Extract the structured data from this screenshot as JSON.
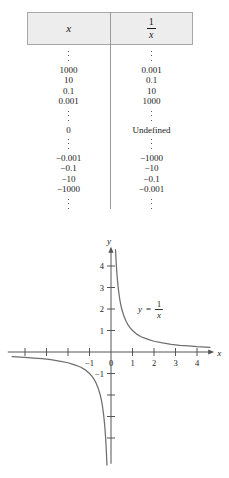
{
  "figure": {
    "title": "",
    "table": {
      "headers": {
        "left": "x",
        "right_numerator": "1",
        "right_denominator": "x"
      },
      "rows": [
        {
          "x": "⋮",
          "inv": "⋮",
          "type": "dots"
        },
        {
          "x": "1000",
          "inv": "0.001",
          "type": "value"
        },
        {
          "x": "10",
          "inv": "0.1",
          "type": "value"
        },
        {
          "x": "0.1",
          "inv": "10",
          "type": "value"
        },
        {
          "x": "0.001",
          "inv": "1000",
          "type": "value"
        },
        {
          "x": "⋮",
          "inv": "⋮",
          "type": "dots"
        },
        {
          "x": "0",
          "inv": "Undefined",
          "type": "value"
        },
        {
          "x": "⋮",
          "inv": "⋮",
          "type": "dots"
        },
        {
          "x": "−0.001",
          "inv": "−1000",
          "type": "value"
        },
        {
          "x": "−0.1",
          "inv": "−10",
          "type": "value"
        },
        {
          "x": "−10",
          "inv": "−0.1",
          "type": "value"
        },
        {
          "x": "−1000",
          "inv": "−0.001",
          "type": "value"
        },
        {
          "x": "⋮",
          "inv": "⋮",
          "type": "dots"
        }
      ]
    }
  },
  "chart_data": {
    "type": "line",
    "title": "",
    "xlabel": "x",
    "ylabel": "y",
    "xlim": [
      -4.8,
      4.8
    ],
    "ylim": [
      -5.2,
      4.9
    ],
    "grid": false,
    "legend": "none",
    "annotations": [
      {
        "text": "y = 1/x",
        "numerator": "1",
        "denominator": "x",
        "lhs": "y",
        "equals": "=",
        "x": 1.25,
        "y": 2.0
      }
    ],
    "x_ticks": [
      {
        "value": -4,
        "label": ""
      },
      {
        "value": -3,
        "label": ""
      },
      {
        "value": -2,
        "label": ""
      },
      {
        "value": -1,
        "label": "−1"
      },
      {
        "value": 0,
        "label": "0"
      },
      {
        "value": 1,
        "label": "1"
      },
      {
        "value": 2,
        "label": "2"
      },
      {
        "value": 3,
        "label": "3"
      },
      {
        "value": 4,
        "label": "4"
      }
    ],
    "y_ticks": [
      {
        "value": 4,
        "label": "4"
      },
      {
        "value": 3,
        "label": "3"
      },
      {
        "value": 2,
        "label": "2"
      },
      {
        "value": 1,
        "label": "1"
      },
      {
        "value": -1,
        "label": "−1"
      },
      {
        "value": -2,
        "label": ""
      },
      {
        "value": -3,
        "label": ""
      },
      {
        "value": -4,
        "label": ""
      }
    ],
    "series": [
      {
        "name": "y = 1/x (branch x > 0)",
        "x": [
          0.21,
          0.23,
          0.25,
          0.28,
          0.3,
          0.35,
          0.4,
          0.45,
          0.5,
          0.6,
          0.7,
          0.8,
          0.9,
          1.0,
          1.2,
          1.4,
          1.6,
          1.8,
          2.0,
          2.4,
          2.8,
          3.2,
          3.6,
          4.0,
          4.4,
          4.6
        ],
        "y": [
          4.76,
          4.35,
          4.0,
          3.57,
          3.33,
          2.86,
          2.5,
          2.22,
          2.0,
          1.67,
          1.43,
          1.25,
          1.11,
          1.0,
          0.83,
          0.71,
          0.63,
          0.56,
          0.5,
          0.42,
          0.36,
          0.31,
          0.28,
          0.25,
          0.23,
          0.22
        ]
      },
      {
        "name": "y = 1/x (branch x < 0)",
        "x": [
          -4.6,
          -4.4,
          -4.0,
          -3.6,
          -3.2,
          -2.8,
          -2.4,
          -2.0,
          -1.8,
          -1.6,
          -1.4,
          -1.2,
          -1.0,
          -0.9,
          -0.8,
          -0.7,
          -0.6,
          -0.5,
          -0.45,
          -0.4,
          -0.35,
          -0.3,
          -0.28,
          -0.25,
          -0.23,
          -0.21,
          -0.19
        ],
        "y": [
          -0.22,
          -0.23,
          -0.25,
          -0.28,
          -0.31,
          -0.36,
          -0.42,
          -0.5,
          -0.56,
          -0.63,
          -0.71,
          -0.83,
          -1.0,
          -1.11,
          -1.25,
          -1.43,
          -1.67,
          -2.0,
          -2.22,
          -2.5,
          -2.86,
          -3.33,
          -3.57,
          -4.0,
          -4.35,
          -4.76,
          -5.26
        ]
      }
    ]
  }
}
